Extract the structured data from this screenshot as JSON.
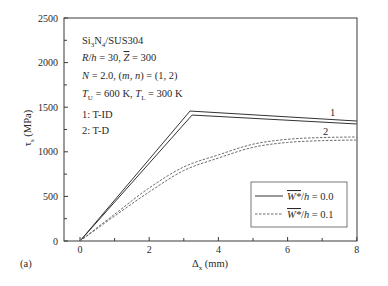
{
  "figure": {
    "panel_label": "(a)",
    "annotations": {
      "material": {
        "a": "Si",
        "a_sub": "3",
        "b": "N",
        "b_sub": "4",
        "rest": "/SUS304"
      },
      "geometry": {
        "r": "R",
        "slash": "/",
        "h": "h",
        "eq1": " = 30, ",
        "z": "Z",
        "eq2": " = 300"
      },
      "params": {
        "n": "N",
        "eq1": " = 2.0, (",
        "m": "m",
        "comma": ", ",
        "nn": "n",
        "eq2": ") = (1, 2)"
      },
      "temps": {
        "tu": "T",
        "tu_sub": "U",
        "eq1": " = 600 K, ",
        "tl": "T",
        "tl_sub": "L",
        "eq2": " = 300 K"
      },
      "curve1": "1: T-ID",
      "curve2": "2: T-D"
    },
    "curve_labels": {
      "one": "1",
      "two": "2"
    },
    "legend": [
      {
        "w": "W*",
        "slash": "/",
        "h": "h",
        "value": " = 0.0",
        "style": "solid"
      },
      {
        "w": "W*",
        "slash": "/",
        "h": "h",
        "value": " = 0.1",
        "style": "dashed"
      }
    ],
    "xaxis_label": {
      "main": "Δ",
      "sub": "x",
      "unit": " (mm)"
    },
    "yaxis_label": {
      "main": "τ",
      "sub": "s",
      "unit": " (MPa)"
    }
  },
  "colors": {
    "solid": "#333333",
    "dashed": "#6a6a6a",
    "axis": "#3a3a3a"
  },
  "chart_data": {
    "type": "line",
    "title": "",
    "xlabel": "Δx (mm)",
    "ylabel": "τs (MPa)",
    "xlim": [
      -0.46,
      8
    ],
    "ylim": [
      0,
      2500
    ],
    "xticks_major": [
      0,
      2,
      4,
      6,
      8
    ],
    "xticks_minor": [
      1,
      3,
      5,
      7
    ],
    "yticks_major": [
      0,
      500,
      1000,
      1500,
      2000,
      2500
    ],
    "yticks_minor": [
      250,
      750,
      1250,
      1750,
      2250
    ],
    "grid": false,
    "legend_position": "lower right",
    "annotations": [
      "Si3N4/SUS304",
      "R/h = 30, Z̄ = 300",
      "N = 2.0, (m, n) = (1, 2)",
      "TU = 600 K, TL = 300 K",
      "1: T-ID",
      "2: T-D"
    ],
    "series": [
      {
        "name": "W*/h = 0.0, 1: T-ID",
        "style": "solid",
        "smooth": false,
        "x": [
          0,
          3.18,
          8
        ],
        "y": [
          0,
          1457,
          1345
        ]
      },
      {
        "name": "W*/h = 0.0, 2: T-D",
        "style": "solid",
        "smooth": false,
        "x": [
          0,
          3.24,
          8
        ],
        "y": [
          0,
          1412,
          1312
        ]
      },
      {
        "name": "W*/h = 0.1, 1: T-ID",
        "style": "dashed",
        "smooth": true,
        "x": [
          0,
          1,
          2,
          3,
          4,
          5,
          6,
          7,
          8
        ],
        "y": [
          0,
          300,
          595,
          830,
          965,
          1085,
          1140,
          1160,
          1166
        ]
      },
      {
        "name": "W*/h = 0.1, 2: T-D",
        "style": "dashed",
        "smooth": true,
        "x": [
          0,
          1,
          2,
          3,
          4,
          5,
          6,
          7,
          8
        ],
        "y": [
          0,
          280,
          550,
          790,
          930,
          1050,
          1105,
          1125,
          1132
        ]
      }
    ]
  }
}
